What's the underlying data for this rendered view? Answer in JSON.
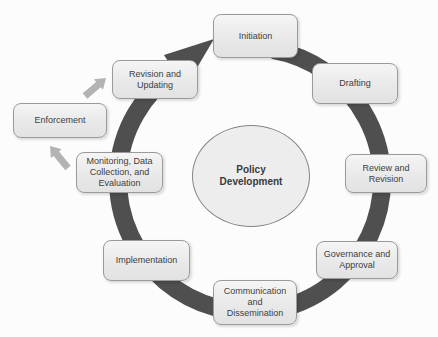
{
  "diagram": {
    "center_label": "Policy Development",
    "stages": [
      {
        "id": "initiation",
        "label": "Initiation"
      },
      {
        "id": "drafting",
        "label": "Drafting"
      },
      {
        "id": "review-and-revision",
        "label": "Review and Revision"
      },
      {
        "id": "governance-and-approval",
        "label": "Governance and Approval"
      },
      {
        "id": "communication-and-dissemination",
        "label": "Communication and Dissemination"
      },
      {
        "id": "implementation",
        "label": "Implementation"
      },
      {
        "id": "monitoring-data-collection-and-evaluation",
        "label": "Monitoring, Data Collection, and Evaluation"
      },
      {
        "id": "revision-and-updating",
        "label": "Revision and Updating"
      },
      {
        "id": "enforcement",
        "label": "Enforcement"
      }
    ],
    "colors": {
      "ring": "#4f4f4f",
      "box_fill": "#ececec",
      "box_border": "#9a9a9a",
      "text": "#404040",
      "side_arrow": "#b3b3b3",
      "center_fill": "#ededed"
    }
  }
}
